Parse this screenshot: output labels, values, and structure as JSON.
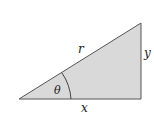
{
  "diagram": {
    "type": "right-triangle",
    "fill_color": "#d9d9d9",
    "stroke_color": "#555555",
    "vertices": {
      "left": [
        19,
        99
      ],
      "top_right": [
        141,
        23
      ],
      "bottom_right": [
        141,
        99
      ]
    },
    "labels": {
      "hypotenuse": "r",
      "opposite": "y",
      "adjacent": "x",
      "angle": "θ"
    }
  }
}
